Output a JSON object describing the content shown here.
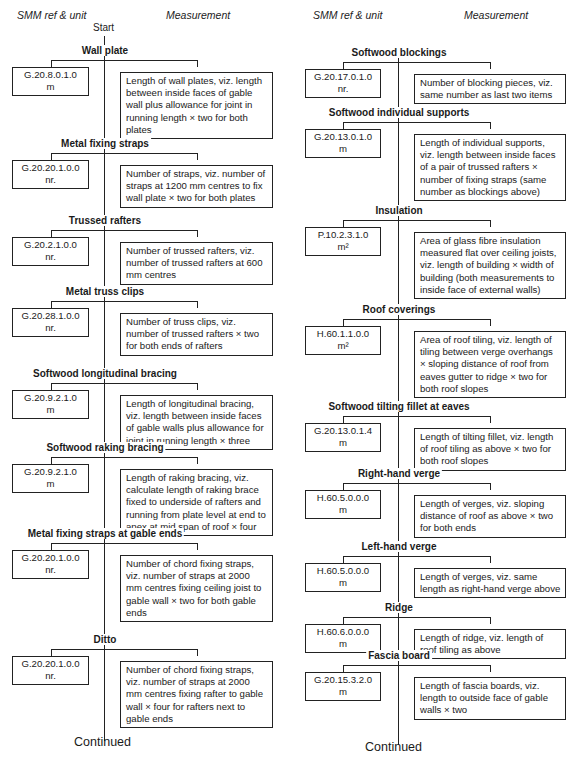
{
  "headers": {
    "left": {
      "ref": "SMM ref & unit",
      "measurement": "Measurement",
      "start": "Start"
    },
    "right": {
      "ref": "SMM ref & unit",
      "measurement": "Measurement"
    }
  },
  "left_items": [
    {
      "title": "Wall plate",
      "ref": "G.20.8.0.1.0",
      "unit": "m",
      "measurement": "Length of wall plates, viz. length between inside faces of gable wall plus allowance for joint in running length × two for both plates"
    },
    {
      "title": "Metal fixing straps",
      "ref": "G.20.20.1.0.0",
      "unit": "nr.",
      "measurement": "Number of straps, viz. number of straps at 1200 mm centres to fix wall plate × two for both plates"
    },
    {
      "title": "Trussed rafters",
      "ref": "G.20.2.1.0.0",
      "unit": "nr.",
      "measurement": "Number of trussed rafters, viz. number of trussed rafters at 600 mm centres"
    },
    {
      "title": "Metal truss clips",
      "ref": "G.20.28.1.0.0",
      "unit": "nr.",
      "measurement": "Number of truss clips, viz. number of trussed rafters × two for both ends of rafters"
    },
    {
      "title": "Softwood longitudinal bracing",
      "ref": "G.20.9.2.1.0",
      "unit": "m",
      "measurement": "Length of longitudinal bracing, viz. length between inside faces of gable walls plus allowance for joint in running length × three"
    },
    {
      "title": "Softwood raking bracing",
      "ref": "G.20.9.2.1.0",
      "unit": "m",
      "measurement": "Length of raking bracing, viz. calculate length of raking brace fixed to underside of rafters and running from plate level at end to apex at mid span of roof × four"
    },
    {
      "title": "Metal fixing straps at gable ends",
      "ref": "G.20.20.1.0.0",
      "unit": "nr.",
      "measurement": "Number of chord fixing straps, viz. number of straps at 2000 mm centres fixing ceiling joist to gable wall × two for both gable ends"
    },
    {
      "title": "Ditto",
      "ref": "G.20.20.1.0.0",
      "unit": "nr.",
      "measurement": "Number of chord fixing straps, viz. number of straps at 2000 mm centres fixing rafter to gable wall × four for rafters next to gable ends"
    }
  ],
  "right_items": [
    {
      "title": "Softwood blockings",
      "ref": "G.20.17.0.1.0",
      "unit": "nr.",
      "measurement": "Number of blocking pieces, viz. same number as last two items"
    },
    {
      "title": "Softwood individual supports",
      "ref": "G.20.13.0.1.0",
      "unit": "m",
      "measurement": "Length of individual supports, viz. length between inside faces of a pair of trussed rafters × number of fixing straps (same number as blockings above)"
    },
    {
      "title": "Insulation",
      "ref": "P.10.2.3.1.0",
      "unit": "m²",
      "measurement": "Area of glass fibre insulation measured flat over ceiling joists, viz. length of building × width of building (both measurements to inside face of external walls)"
    },
    {
      "title": "Roof coverings",
      "ref": "H.60.1.1.0.0",
      "unit": "m²",
      "measurement": "Area of roof tiling, viz. length of tiling between verge overhangs × sloping distance of roof from eaves gutter to ridge × two for both roof slopes"
    },
    {
      "title": "Softwood tilting fillet at eaves",
      "ref": "G.20.13.0.1.4",
      "unit": "m",
      "measurement": "Length of tilting fillet, viz. length of roof tiling as above × two for both roof slopes"
    },
    {
      "title": "Right-hand verge",
      "ref": "H.60.5.0.0.0",
      "unit": "m",
      "measurement": "Length of verges, viz. sloping distance of roof as above × two for both ends"
    },
    {
      "title": "Left-hand verge",
      "ref": "H.60.5.0.0.0",
      "unit": "m",
      "measurement": "Length of verges, viz. same length as right-hand verge above"
    },
    {
      "title": "Ridge",
      "ref": "H.60.6.0.0.0",
      "unit": "m",
      "measurement": "Length of ridge, viz. length of roof tiling as above"
    },
    {
      "title": "Fascia board",
      "ref": "G.20.15.3.2.0",
      "unit": "m",
      "measurement": "Length of fascia boards, viz. length to outside face of gable walls × two"
    }
  ],
  "footer": {
    "left": "Continued",
    "right": "Continued"
  }
}
